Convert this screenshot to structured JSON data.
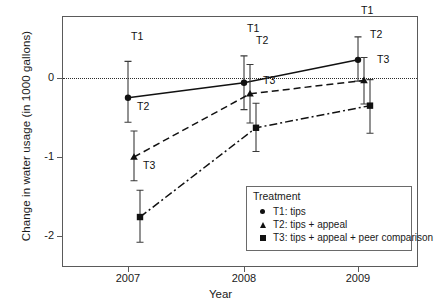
{
  "chart_data": {
    "type": "line",
    "title": "",
    "xlabel": "Year",
    "ylabel": "Change in water usage (in 1000 gallons)",
    "categories": [
      "2007",
      "2008",
      "2009"
    ],
    "x_tick_labels": [
      "2007",
      "2008",
      "2009"
    ],
    "y_tick_labels": [
      "0",
      "-1",
      "-2"
    ],
    "y_tick_values": [
      0,
      -1,
      -2
    ],
    "ylim": [
      -2.35,
      0.62
    ],
    "grid": false,
    "zero_reference_line": 0,
    "legend_position": "inside-lower-right",
    "legend_title": "Treatment",
    "series": [
      {
        "name": "T1: tips",
        "short": "T1",
        "marker": "circle",
        "linestyle": "solid",
        "values": [
          -0.25,
          -0.06,
          0.23
        ],
        "ci_low": [
          -0.56,
          -0.4,
          -0.04
        ],
        "ci_high": [
          0.21,
          0.28,
          0.52
        ],
        "point_labels": [
          "T1",
          "T1",
          "T1"
        ]
      },
      {
        "name": "T2: tips + appeal",
        "short": "T2",
        "marker": "triangle",
        "linestyle": "dashed",
        "values": [
          -1.0,
          -0.2,
          -0.03
        ],
        "ci_low": [
          -1.3,
          -0.57,
          -0.33
        ],
        "ci_high": [
          -0.67,
          0.17,
          0.26
        ],
        "point_labels": [
          "T2",
          "T2",
          "T2"
        ]
      },
      {
        "name": "T3: tips + appeal + peer comparison",
        "short": "T3",
        "marker": "square",
        "linestyle": "dashdot",
        "values": [
          -1.76,
          -0.63,
          -0.35
        ],
        "ci_low": [
          -2.08,
          -0.93,
          -0.7
        ],
        "ci_high": [
          -1.42,
          -0.32,
          -0.02
        ],
        "point_labels": [
          "T3",
          "T3",
          "T3"
        ]
      }
    ]
  },
  "legend": {
    "title": "Treatment",
    "items": [
      {
        "marker": "circle",
        "label": "T1: tips"
      },
      {
        "marker": "triangle",
        "label": "T2: tips + appeal"
      },
      {
        "marker": "square",
        "label": "T3: tips + appeal + peer comparison"
      }
    ]
  },
  "axes": {
    "x_title": "Year",
    "y_title": "Change in water usage (in 1000 gallons)",
    "x_ticks": [
      "2007",
      "2008",
      "2009"
    ],
    "y_ticks": [
      "0",
      "-1",
      "-2"
    ]
  },
  "colors": {
    "ink": "#111111",
    "frame": "#5a5a5a",
    "background": "#ffffff"
  }
}
